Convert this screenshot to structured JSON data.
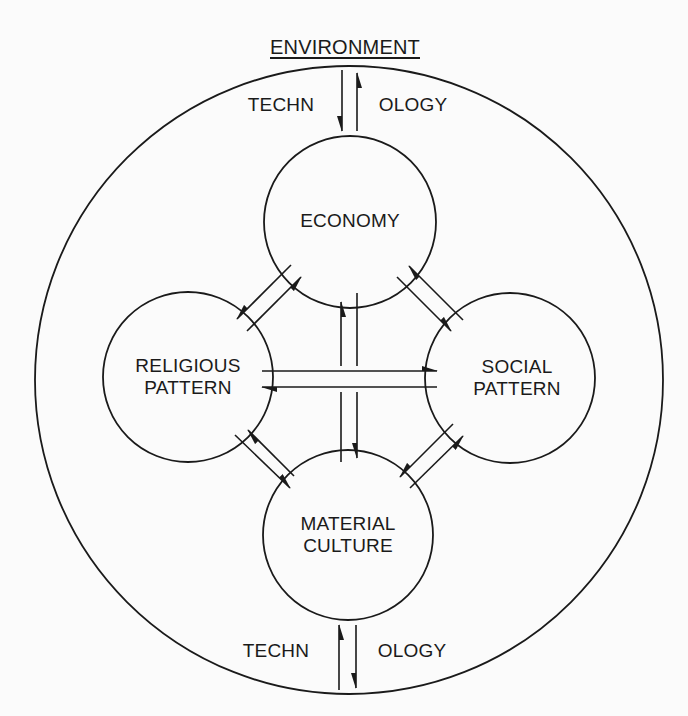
{
  "diagram": {
    "title": "ENVIRONMENT",
    "outer_circle": {
      "cx": 349,
      "cy": 380,
      "r": 314
    },
    "nodes": [
      {
        "id": "economy",
        "lines": [
          "ECONOMY"
        ],
        "cx": 350,
        "cy": 222,
        "r": 86
      },
      {
        "id": "religious",
        "lines": [
          "RELIGIOUS",
          "PATTERN"
        ],
        "cx": 188,
        "cy": 377,
        "r": 85
      },
      {
        "id": "social",
        "lines": [
          "SOCIAL",
          "PATTERN"
        ],
        "cx": 510,
        "cy": 378,
        "r": 85
      },
      {
        "id": "material",
        "lines": [
          "MATERIAL",
          "CULTURE"
        ],
        "cx": 348,
        "cy": 535,
        "r": 85
      }
    ],
    "top_technology": {
      "left": "TECHN",
      "right": "OLOGY"
    },
    "bottom_technology": {
      "left": "TECHN",
      "right": "OLOGY"
    },
    "edges": [
      {
        "from": "environment",
        "to": "economy",
        "direction": "both",
        "label": "TECHNOLOGY"
      },
      {
        "from": "material",
        "to": "environment",
        "direction": "both",
        "label": "TECHNOLOGY"
      },
      {
        "from": "economy",
        "to": "religious",
        "direction": "both"
      },
      {
        "from": "economy",
        "to": "social",
        "direction": "both"
      },
      {
        "from": "economy",
        "to": "material",
        "direction": "both"
      },
      {
        "from": "religious",
        "to": "social",
        "direction": "both"
      },
      {
        "from": "religious",
        "to": "material",
        "direction": "both"
      },
      {
        "from": "social",
        "to": "material",
        "direction": "both"
      }
    ],
    "colors": {
      "line": "#1a1a1a",
      "background": "#fbfbfb"
    }
  }
}
